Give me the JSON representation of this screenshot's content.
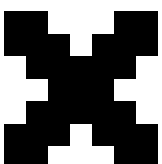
{
  "icon": {
    "name": "pixel-x-icon",
    "fill_color": "#000000",
    "background_color": "#ffffff",
    "grid": {
      "origin_x": 4,
      "origin_y": 11,
      "cell_w": 22,
      "cell_h": 22.5,
      "cols": 7,
      "rows": 7
    },
    "rows": [
      [
        1,
        1,
        0,
        0,
        0,
        1,
        1
      ],
      [
        1,
        1,
        1,
        0,
        1,
        1,
        1
      ],
      [
        0,
        1,
        1,
        1,
        1,
        1,
        0
      ],
      [
        0,
        0,
        1,
        1,
        1,
        0,
        0
      ],
      [
        0,
        1,
        1,
        1,
        1,
        1,
        0
      ],
      [
        1,
        1,
        1,
        0,
        1,
        1,
        1
      ],
      [
        1,
        1,
        0,
        0,
        0,
        1,
        1
      ]
    ]
  }
}
